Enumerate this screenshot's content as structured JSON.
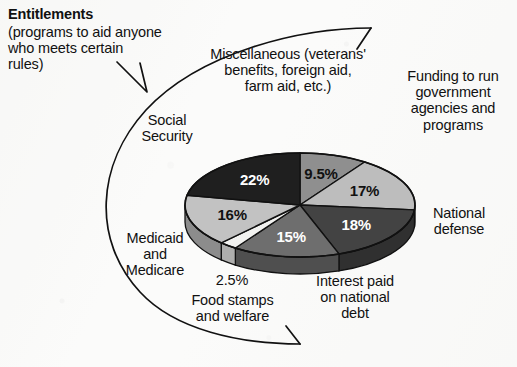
{
  "figure": {
    "kind": "pie-chart-scan",
    "background_color": "#fbfbfa",
    "ink_color": "#111111"
  },
  "callout": {
    "title": "Entitlements",
    "description": "(programs to aid anyone\nwho meets certain\nrules)"
  },
  "labels": {
    "miscellaneous": "Miscellaneous (veterans'\nbenefits, foreign aid,\nfarm aid, etc.)",
    "funding": "Funding to run\ngovernment\nagencies and\nprograms",
    "national_defense": "National\ndefense",
    "interest": "Interest paid\non national\ndebt",
    "food_stamps": "Food stamps\nand welfare",
    "food_stamps_pct": "2.5%",
    "medicaid": "Medicaid\nand\nMedicare",
    "social_security": "Social\nSecurity"
  },
  "chart_data": {
    "type": "pie",
    "xlabel": "",
    "ylabel": "",
    "units": "percent of federal budget",
    "legend": "callout labels placed around the pie",
    "grid": false,
    "categories": [
      "Miscellaneous (veterans' benefits, foreign aid, farm aid, etc.)",
      "Funding to run government agencies and programs",
      "National defense",
      "Interest paid on national debt",
      "Food stamps and welfare",
      "Medicaid and Medicare",
      "Social Security"
    ],
    "values": [
      9.5,
      17,
      18,
      15,
      2.5,
      16,
      22
    ],
    "value_labels": [
      "9.5%",
      "17%",
      "18%",
      "15%",
      "2.5%",
      "16%",
      "22%"
    ],
    "slice_colors": [
      "#8f8f8f",
      "#bdbdbd",
      "#434343",
      "#6e6e6e",
      "#f2f2f0",
      "#c2c2c2",
      "#1f1f1f"
    ],
    "slice_label_colors": [
      "#111111",
      "#111111",
      "#ffffff",
      "#ffffff",
      "#111111",
      "#111111",
      "#ffffff"
    ],
    "slices": [
      {
        "name": "Miscellaneous (veterans' benefits, foreign aid, farm aid, etc.)",
        "value": 9.5,
        "label": "9.5%",
        "color": "#8f8f8f"
      },
      {
        "name": "Funding to run government agencies and programs",
        "value": 17,
        "label": "17%",
        "color": "#bdbdbd"
      },
      {
        "name": "National defense",
        "value": 18,
        "label": "18%",
        "color": "#434343"
      },
      {
        "name": "Interest paid on national debt",
        "value": 15,
        "label": "15%",
        "color": "#6e6e6e"
      },
      {
        "name": "Food stamps and welfare",
        "value": 2.5,
        "label": "2.5%",
        "color": "#f2f2f0"
      },
      {
        "name": "Medicaid and Medicare",
        "value": 16,
        "label": "16%",
        "color": "#c2c2c2"
      },
      {
        "name": "Social Security",
        "value": 22,
        "label": "22%",
        "color": "#1f1f1f"
      }
    ],
    "entitlement_group": [
      "Social Security",
      "Medicaid and Medicare",
      "Food stamps and welfare"
    ],
    "total": 100
  }
}
